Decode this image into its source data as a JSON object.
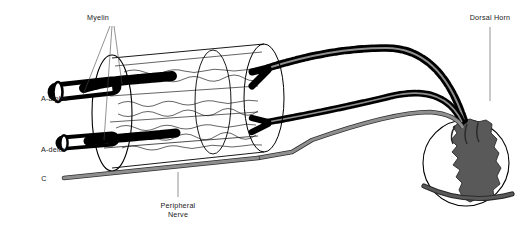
{
  "figure": {
    "background_color": "#ffffff",
    "width": 526,
    "height": 232
  },
  "labels": {
    "myelin": "Myelin",
    "a_alpha": "A-alpha",
    "a_delta": "A-delta",
    "c_fiber": "C",
    "peripheral_nerve_line1": "Peripheral",
    "peripheral_nerve_line2": "Nerve",
    "dorsal_horn": "Dorsal Horn"
  },
  "colors": {
    "myelin_black": "#000000",
    "axon_gray": "#8a8a8a",
    "c_fiber_gray": "#8f8f8f",
    "gray_matter": "#595959",
    "white_matter": "#ffffff",
    "outline": "#000000",
    "leader_line": "#4a4a4a",
    "text": "#1a1a1a"
  },
  "structures": [
    {
      "name": "a-alpha-fiber",
      "label": "A-alpha",
      "myelinated": true,
      "description": "Large diameter heavily myelinated fiber"
    },
    {
      "name": "a-delta-fiber",
      "label": "A-delta",
      "myelinated": true,
      "description": "Medium diameter thinly myelinated fiber"
    },
    {
      "name": "c-fiber",
      "label": "C",
      "myelinated": false,
      "description": "Small diameter unmyelinated fiber"
    },
    {
      "name": "peripheral-nerve",
      "label": "Peripheral Nerve",
      "description": "Transparent cylinder bundle containing fascicles"
    },
    {
      "name": "dorsal-horn",
      "label": "Dorsal Horn",
      "description": "Gray matter of spinal cord cross-section"
    }
  ],
  "label_positions": {
    "myelin": {
      "x": 98,
      "y": 17
    },
    "a_alpha": {
      "x": 41,
      "y": 101
    },
    "a_delta": {
      "x": 41,
      "y": 152
    },
    "c_fiber": {
      "x": 38,
      "y": 181
    },
    "peripheral_nerve": {
      "x": 190,
      "y": 207
    },
    "dorsal_horn": {
      "x": 490,
      "y": 20
    }
  }
}
